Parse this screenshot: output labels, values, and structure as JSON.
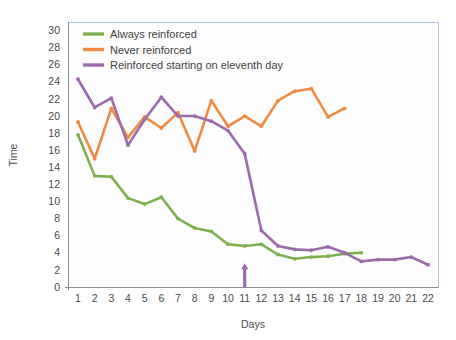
{
  "chart_data": {
    "type": "line",
    "title": "",
    "xlabel": "Days",
    "ylabel": "Time",
    "x": [
      1,
      2,
      3,
      4,
      5,
      6,
      7,
      8,
      9,
      10,
      11,
      12,
      13,
      14,
      15,
      16,
      17,
      18,
      19,
      20,
      21,
      22
    ],
    "xticklabels": [
      "1",
      "2",
      "3",
      "4",
      "5",
      "6",
      "7",
      "8",
      "9",
      "10",
      "11",
      "12",
      "13",
      "14",
      "15",
      "16",
      "17",
      "18",
      "19",
      "20",
      "21",
      "22"
    ],
    "yticklabels": [
      "0",
      "2",
      "4",
      "6",
      "8",
      "10",
      "12",
      "14",
      "16",
      "18",
      "20",
      "22",
      "24",
      "26",
      "28",
      "30"
    ],
    "yticks": [
      0,
      2,
      4,
      6,
      8,
      10,
      12,
      14,
      16,
      18,
      20,
      22,
      24,
      26,
      28,
      30
    ],
    "xlim": [
      0.4,
      22.6
    ],
    "ylim": [
      0,
      31
    ],
    "grid": true,
    "legend_position": "top-left",
    "series": [
      {
        "name": "Always reinforced",
        "color": "#7fb04f",
        "x": [
          1,
          2,
          3,
          4,
          5,
          6,
          7,
          8,
          9,
          10,
          11,
          12,
          13,
          14,
          15,
          16,
          17,
          18
        ],
        "values": [
          17.8,
          13.0,
          12.9,
          10.4,
          9.7,
          10.5,
          8.0,
          6.9,
          6.5,
          5.0,
          4.8,
          5.0,
          3.8,
          3.3,
          3.5,
          3.6,
          3.9,
          4.0
        ]
      },
      {
        "name": "Never reinforced",
        "color": "#ef8a43",
        "x": [
          1,
          2,
          3,
          4,
          5,
          6,
          7,
          8,
          9,
          10,
          11,
          12,
          13,
          14,
          15,
          16,
          17
        ],
        "values": [
          19.3,
          15.0,
          20.9,
          17.5,
          19.9,
          18.6,
          20.4,
          15.9,
          21.8,
          18.8,
          20.0,
          18.8,
          21.8,
          22.9,
          23.2,
          19.9,
          20.9
        ]
      },
      {
        "name": "Reinforced starting on eleventh day",
        "color": "#9b6bab",
        "x": [
          1,
          2,
          3,
          4,
          5,
          6,
          7,
          8,
          9,
          10,
          11,
          12,
          13,
          14,
          15,
          16,
          17,
          18,
          19,
          20,
          21,
          22
        ],
        "values": [
          24.3,
          21.0,
          22.1,
          16.6,
          19.6,
          22.2,
          20.0,
          20.0,
          19.4,
          18.3,
          15.6,
          6.6,
          4.8,
          4.4,
          4.3,
          4.7,
          4.0,
          3.0,
          3.2,
          3.2,
          3.5,
          2.6
        ]
      }
    ],
    "annotations": [
      {
        "name": "reinforcement-start-arrow",
        "type": "arrow-up",
        "x": 11,
        "y_from": 0,
        "y_to": 2.6,
        "color": "#9b6bab"
      }
    ]
  },
  "legend": {
    "items": [
      {
        "label": "Always reinforced",
        "color": "#7fb04f"
      },
      {
        "label": "Never reinforced",
        "color": "#ef8a43"
      },
      {
        "label": "Reinforced starting on eleventh day",
        "color": "#9b6bab"
      }
    ]
  },
  "colors": {
    "grid": "#bdd4ee",
    "grid_major": "#9dbfe3",
    "axis": "#8d8d8d",
    "text": "#4a4a4a",
    "background": "#ffffff",
    "plot_background": "#fdfdfd"
  }
}
